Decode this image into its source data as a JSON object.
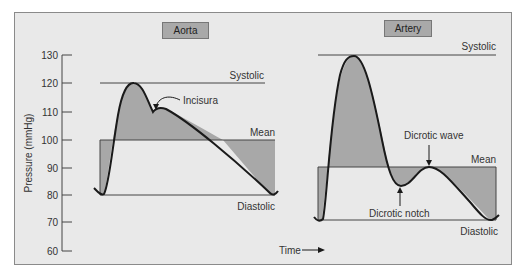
{
  "panels": {
    "aorta": {
      "title": "Aorta",
      "labels": {
        "systolic": "Systolic",
        "mean": "Mean",
        "diastolic": "Diastolic",
        "incisura": "Incisura"
      }
    },
    "artery": {
      "title": "Artery",
      "labels": {
        "systolic": "Systolic",
        "mean": "Mean",
        "diastolic": "Diastolic",
        "dicrotic_wave": "Dicrotic wave",
        "dicrotic_notch": "Dicrotic notch"
      }
    }
  },
  "axis": {
    "ylabel": "Pressure (mmHg)",
    "xlabel": "Time",
    "ticks": [
      "130",
      "120",
      "110",
      "100",
      "90",
      "80",
      "70",
      "60"
    ]
  },
  "colors": {
    "background": "#e9e9e9",
    "fill": "#a8a8a8",
    "curve": "#1a1a1a",
    "title_box": "#a9a9a9"
  }
}
